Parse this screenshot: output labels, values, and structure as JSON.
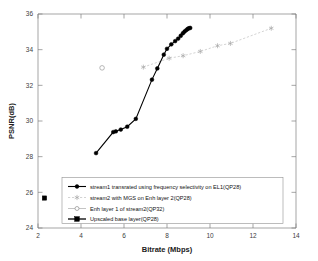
{
  "chart_data": {
    "type": "line",
    "title": "",
    "xlabel": "Bitrate (Mbps)",
    "ylabel": "PSNR(dB)",
    "xlim": [
      2,
      14
    ],
    "ylim": [
      24,
      36
    ],
    "xticks": [
      "2",
      "4",
      "6",
      "8",
      "10",
      "12",
      "14"
    ],
    "yticks": [
      "24",
      "26",
      "28",
      "30",
      "32",
      "34",
      "36"
    ],
    "grid": false,
    "legend_position": "lower-left-inside",
    "series": [
      {
        "name": "stream1 transrated using frequency selectivity on EL1(QP28)",
        "style": "solid-black-filled-circle",
        "color": "#000000",
        "x": [
          4.7,
          5.5,
          5.62,
          5.85,
          6.15,
          6.55,
          7.3,
          7.55,
          7.85,
          8.0,
          8.2,
          8.38,
          8.52,
          8.64,
          8.74,
          8.82,
          8.9,
          8.96,
          9.02,
          9.08
        ],
        "y": [
          28.2,
          29.38,
          29.42,
          29.52,
          29.68,
          30.12,
          32.32,
          32.95,
          33.72,
          34.05,
          34.3,
          34.48,
          34.62,
          34.78,
          34.92,
          35.02,
          35.1,
          35.16,
          35.2,
          35.22
        ]
      },
      {
        "name": "stream2 with MGS on Enh layer 2(QP28)",
        "style": "dashed-gray-star",
        "color": "#c0c0c0",
        "x": [
          6.9,
          8.1,
          8.75,
          9.55,
          10.35,
          10.95,
          12.85
        ],
        "y": [
          33.02,
          33.52,
          33.66,
          33.9,
          34.22,
          34.35,
          35.2
        ]
      },
      {
        "name": "Enh layer 1 of stream2(QP32)",
        "style": "gray-open-circle",
        "color": "#9a9a9a",
        "x": [
          4.98
        ],
        "y": [
          32.98
        ]
      },
      {
        "name": "Upscaled base layer(QP28)",
        "style": "black-filled-square",
        "color": "#000000",
        "x": [
          2.3
        ],
        "y": [
          25.68
        ]
      }
    ]
  },
  "legend": {
    "items": [
      {
        "label": "stream1 transrated using frequency selectivity on EL1(QP28)",
        "marker": "filled-circle-solid-line"
      },
      {
        "label": "stream2 with MGS on Enh layer 2(QP28)",
        "marker": "star-dashed-line"
      },
      {
        "label": "Enh layer 1 of stream2(QP32)",
        "marker": "open-circle-line"
      },
      {
        "label": "Upscaled base layer(QP28)",
        "marker": "filled-square-line"
      }
    ]
  }
}
